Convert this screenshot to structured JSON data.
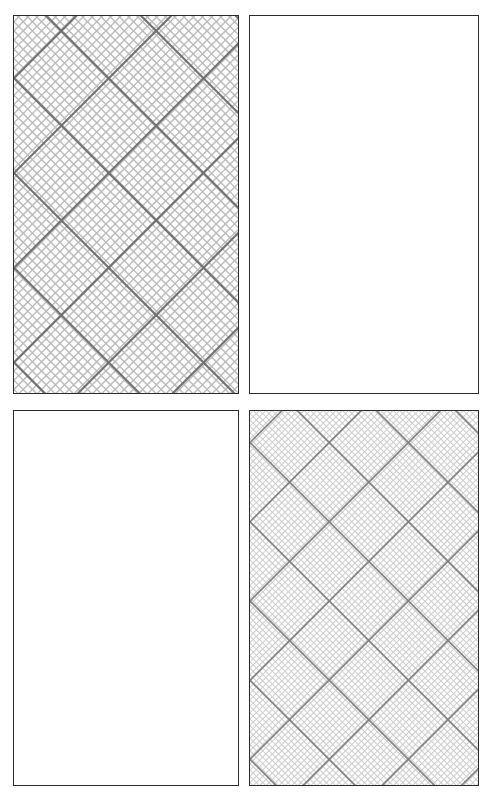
{
  "canvas": {
    "width": 494,
    "height": 801,
    "background_color": "#ffffff"
  },
  "figure": {
    "title": "",
    "panel_count": 4,
    "rows": 2,
    "columns": 2,
    "border_color": "#2b2b2b",
    "border_width_px": 1,
    "panel_background": "#ffffff"
  },
  "panels": [
    {
      "id": "panel-top-left",
      "name": "top-left-panel",
      "row": 1,
      "column": 1,
      "x": 13,
      "y": 15,
      "width": 226,
      "height": 379,
      "filled": true,
      "fill_style": "diagonal-crosshatch",
      "label": "",
      "hatch": {
        "angle_degrees": 45,
        "directions": 2,
        "minor_pitch_px": 6.5,
        "minor_stroke_width_px": 1.5,
        "minor_color": "#b8b8b8",
        "minor_opacity": 0.9,
        "major_pitch_px": 67,
        "major_stroke_width_px": 2.2,
        "major_color": "#6e6e6e",
        "major_opacity": 0.95,
        "density": "dense"
      }
    },
    {
      "id": "panel-top-right",
      "name": "top-right-panel",
      "row": 1,
      "column": 2,
      "x": 249,
      "y": 15,
      "width": 230,
      "height": 379,
      "filled": false,
      "fill_style": "blank",
      "label": "",
      "hatch": null
    },
    {
      "id": "panel-bottom-left",
      "name": "bottom-left-panel",
      "row": 2,
      "column": 1,
      "x": 13,
      "y": 410,
      "width": 226,
      "height": 376,
      "filled": false,
      "fill_style": "blank",
      "label": "",
      "hatch": null
    },
    {
      "id": "panel-bottom-right",
      "name": "bottom-right-panel",
      "row": 2,
      "column": 2,
      "x": 249,
      "y": 410,
      "width": 230,
      "height": 376,
      "filled": true,
      "fill_style": "diagonal-crosshatch",
      "label": "",
      "hatch": {
        "angle_degrees": 45,
        "directions": 2,
        "minor_pitch_px": 4.5,
        "minor_stroke_width_px": 1.1,
        "minor_color": "#c9c9c9",
        "minor_opacity": 0.85,
        "major_pitch_px": 56,
        "major_stroke_width_px": 1.8,
        "major_color": "#7d7d7d",
        "major_opacity": 0.9,
        "density": "fine"
      }
    }
  ]
}
